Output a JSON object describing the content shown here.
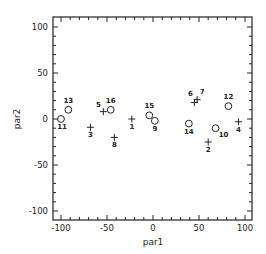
{
  "chart_data": {
    "type": "scatter",
    "title": "",
    "xlabel": "par1",
    "ylabel": "par2",
    "xlim": [
      -110,
      110
    ],
    "ylim": [
      -110,
      110
    ],
    "xticks": [
      -100,
      -50,
      0,
      50,
      100
    ],
    "yticks": [
      -100,
      -50,
      0,
      50,
      100
    ],
    "grid": false,
    "legend": null,
    "series": [
      {
        "name": "plus-markers",
        "marker": "plus",
        "points": [
          {
            "label": "1",
            "x": -23,
            "y": 0
          },
          {
            "label": "2",
            "x": 60,
            "y": -25
          },
          {
            "label": "3",
            "x": -68,
            "y": -9
          },
          {
            "label": "4",
            "x": 93,
            "y": -3
          },
          {
            "label": "5",
            "x": -54,
            "y": 8
          },
          {
            "label": "6",
            "x": 45,
            "y": 18
          },
          {
            "label": "7",
            "x": 48,
            "y": 21
          },
          {
            "label": "8",
            "x": -42,
            "y": -20
          }
        ]
      },
      {
        "name": "circle-markers",
        "marker": "circle",
        "points": [
          {
            "label": "9",
            "x": 2,
            "y": -2
          },
          {
            "label": "10",
            "x": 68,
            "y": -10
          },
          {
            "label": "11",
            "x": -100,
            "y": 0
          },
          {
            "label": "12",
            "x": 82,
            "y": 14
          },
          {
            "label": "13",
            "x": -92,
            "y": 10
          },
          {
            "label": "14",
            "x": 39,
            "y": -5
          },
          {
            "label": "15",
            "x": -4,
            "y": 4
          },
          {
            "label": "16",
            "x": -46,
            "y": 10
          }
        ]
      }
    ]
  }
}
